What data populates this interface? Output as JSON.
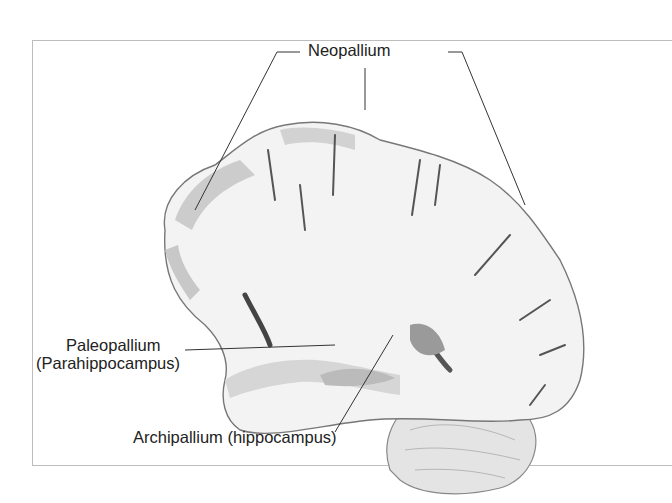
{
  "figure": {
    "labels": {
      "neopallium": "Neopallium",
      "paleopallium_line1": "Paleopallium",
      "paleopallium_line2": "(Parahippocampus)",
      "archipallium": "Archipallium (hippocampus)"
    },
    "colors": {
      "white_matter": "#f2f2f2",
      "cortex": "#cfcfcf",
      "sulcus": "#555555",
      "leader_line": "#333333"
    }
  }
}
